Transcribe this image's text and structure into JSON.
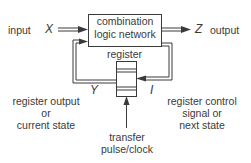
{
  "diagram": {
    "type": "sequential-logic-block-diagram",
    "nodes": {
      "logic_network": {
        "line1": "combination",
        "line2": "logic network"
      },
      "register": {
        "label": "register"
      }
    },
    "signals": {
      "input": {
        "label": "input",
        "symbol": "X"
      },
      "output": {
        "label": "output",
        "symbol": "Z"
      },
      "state": {
        "symbol": "Y",
        "line1": "register output",
        "line2": "or",
        "line3": "current state"
      },
      "control": {
        "symbol": "I",
        "line1": "register control",
        "line2": "signal or",
        "line3": "next state"
      },
      "clock": {
        "line1": "transfer",
        "line2": "pulse/clock"
      }
    },
    "edges": [
      {
        "from": "input",
        "to": "logic_network",
        "label": "X"
      },
      {
        "from": "logic_network",
        "to": "output",
        "label": "Z"
      },
      {
        "from": "register",
        "to": "logic_network",
        "label": "Y"
      },
      {
        "from": "logic_network",
        "to": "register",
        "label": "I"
      },
      {
        "from": "clock",
        "to": "register",
        "label": "transfer pulse/clock"
      }
    ],
    "colors": {
      "line": "#3a3a3a",
      "text": "#3a3a3a",
      "background": "#ffffff"
    }
  }
}
